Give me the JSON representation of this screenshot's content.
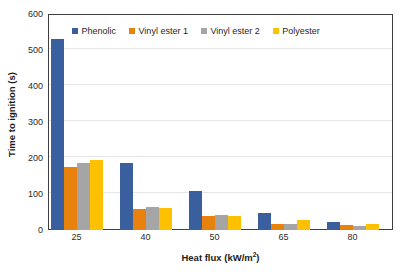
{
  "chart_data": {
    "type": "bar",
    "title": "",
    "xlabel": "Heat flux (kW/m2)",
    "xlabel_base": "Heat flux (kW/m",
    "xlabel_sup": "2",
    "xlabel_tail": ")",
    "ylabel": "Time to ignition (s)",
    "categories": [
      "25",
      "40",
      "50",
      "65",
      "80"
    ],
    "ylim": [
      0,
      600
    ],
    "yticks": [
      0,
      100,
      200,
      300,
      400,
      500,
      600
    ],
    "ytick_labels": [
      "0",
      "100",
      "200",
      "300",
      "400",
      "500",
      "600"
    ],
    "grid": "horizontal",
    "legend_position": "top-center-inside",
    "series": [
      {
        "name": "Phenolic",
        "color": "#3A5F9E",
        "values": [
          530,
          185,
          107,
          48,
          23
        ]
      },
      {
        "name": "Vinyl ester 1",
        "color": "#E8820C",
        "values": [
          175,
          58,
          40,
          18,
          13
        ]
      },
      {
        "name": "Vinyl ester 2",
        "color": "#A5A5A5",
        "values": [
          185,
          65,
          42,
          18,
          12
        ]
      },
      {
        "name": "Polyester",
        "color": "#FFC000",
        "values": [
          194,
          60,
          40,
          28,
          17
        ]
      }
    ]
  },
  "legend": {
    "items": [
      {
        "label": "Phenolic",
        "color": "#3A5F9E"
      },
      {
        "label": "Vinyl ester 1",
        "color": "#E8820C"
      },
      {
        "label": "Vinyl ester 2",
        "color": "#A5A5A5"
      },
      {
        "label": "Polyester",
        "color": "#FFC000"
      }
    ]
  },
  "colors": {
    "plot_border": "#3f3f3f",
    "gridline": "#e4e7ea",
    "background": "#ffffff",
    "text": "#1f1f1f"
  }
}
